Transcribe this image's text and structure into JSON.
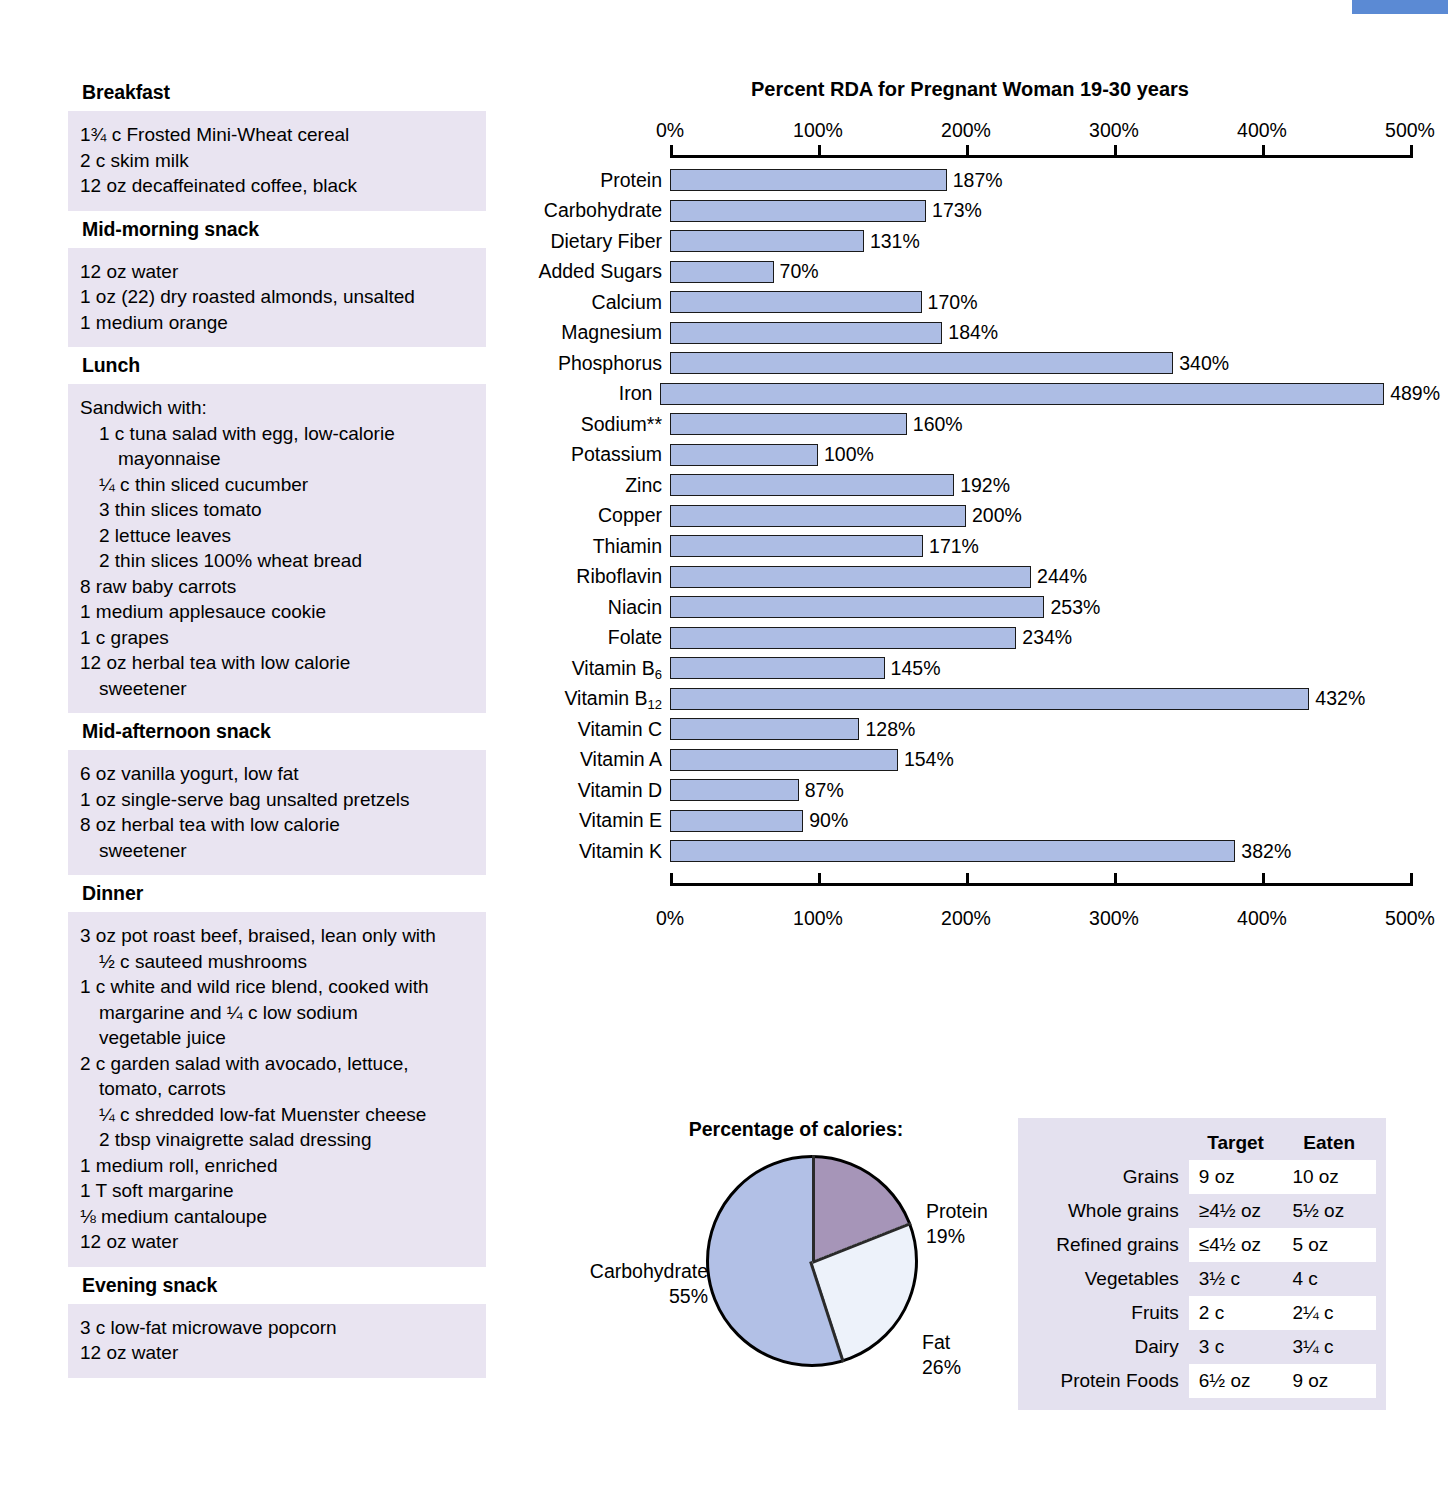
{
  "meals": [
    {
      "heading": "Breakfast",
      "items": [
        {
          "text": "1¾ c Frosted Mini-Wheat cereal",
          "indent": 0
        },
        {
          "text": "2 c skim milk",
          "indent": 0
        },
        {
          "text": "12 oz decaffeinated coffee, black",
          "indent": 0
        }
      ]
    },
    {
      "heading": "Mid-morning snack",
      "items": [
        {
          "text": "12 oz water",
          "indent": 0
        },
        {
          "text": "1 oz (22) dry roasted almonds, unsalted",
          "indent": 0
        },
        {
          "text": "1 medium orange",
          "indent": 0
        }
      ]
    },
    {
      "heading": "Lunch",
      "items": [
        {
          "text": "Sandwich with:",
          "indent": 0
        },
        {
          "text": "1 c tuna salad with egg, low-calorie",
          "indent": 1
        },
        {
          "text": "mayonnaise",
          "indent": 2
        },
        {
          "text": "¼ c thin sliced cucumber",
          "indent": 1
        },
        {
          "text": "3 thin slices tomato",
          "indent": 1
        },
        {
          "text": "2 lettuce leaves",
          "indent": 1
        },
        {
          "text": "2 thin slices 100% wheat bread",
          "indent": 1
        },
        {
          "text": "8 raw baby carrots",
          "indent": 0
        },
        {
          "text": "1 medium applesauce cookie",
          "indent": 0
        },
        {
          "text": "1 c grapes",
          "indent": 0
        },
        {
          "text": "12 oz herbal tea with low calorie",
          "indent": 0
        },
        {
          "text": "sweetener",
          "indent": 1
        }
      ]
    },
    {
      "heading": "Mid-afternoon snack",
      "items": [
        {
          "text": "6 oz vanilla yogurt, low fat",
          "indent": 0
        },
        {
          "text": "1 oz single-serve bag unsalted pretzels",
          "indent": 0
        },
        {
          "text": "8 oz herbal tea with low calorie",
          "indent": 0
        },
        {
          "text": "sweetener",
          "indent": 1
        }
      ]
    },
    {
      "heading": "Dinner",
      "items": [
        {
          "text": "3 oz pot roast beef, braised, lean only with",
          "indent": 0
        },
        {
          "text": "½ c sauteed mushrooms",
          "indent": 1
        },
        {
          "text": "1 c white and wild rice blend, cooked with",
          "indent": 0
        },
        {
          "text": "margarine and ¼ c low sodium",
          "indent": 1
        },
        {
          "text": "vegetable juice",
          "indent": 1
        },
        {
          "text": "2 c garden salad with avocado, lettuce,",
          "indent": 0
        },
        {
          "text": "tomato, carrots",
          "indent": 1
        },
        {
          "text": "¼ c shredded low-fat Muenster cheese",
          "indent": 1
        },
        {
          "text": "2 tbsp vinaigrette salad dressing",
          "indent": 1
        },
        {
          "text": "1 medium roll, enriched",
          "indent": 0
        },
        {
          "text": "1 T soft margarine",
          "indent": 0
        },
        {
          "text": "⅛ medium cantaloupe",
          "indent": 0
        },
        {
          "text": "12 oz water",
          "indent": 0
        }
      ]
    },
    {
      "heading": "Evening snack",
      "items": [
        {
          "text": "3 c low-fat microwave popcorn",
          "indent": 0
        },
        {
          "text": "12 oz water",
          "indent": 0
        }
      ]
    }
  ],
  "chart_data": [
    {
      "type": "bar",
      "title": "Percent RDA for Pregnant Woman 19-30 years",
      "orientation": "horizontal",
      "xlabel": "",
      "ylabel": "",
      "xlim": [
        0,
        500
      ],
      "xticks": [
        0,
        100,
        200,
        300,
        400,
        500
      ],
      "xtick_labels": [
        "0%",
        "100%",
        "200%",
        "300%",
        "400%",
        "500%"
      ],
      "grid": false,
      "axis_top": true,
      "axis_bottom": true,
      "bar_color": "#adbde4",
      "bar_border": "#1a1a1a",
      "categories": [
        "Protein",
        "Carbohydrate",
        "Dietary Fiber",
        "Added Sugars",
        "Calcium",
        "Magnesium",
        "Phosphorus",
        "Iron",
        "Sodium**",
        "Potassium",
        "Zinc",
        "Copper",
        "Thiamin",
        "Riboflavin",
        "Niacin",
        "Folate",
        "Vitamin B6",
        "Vitamin B12",
        "Vitamin C",
        "Vitamin A",
        "Vitamin D",
        "Vitamin E",
        "Vitamin K"
      ],
      "values": [
        187,
        173,
        131,
        70,
        170,
        184,
        340,
        489,
        160,
        100,
        192,
        200,
        171,
        244,
        253,
        234,
        145,
        432,
        128,
        154,
        87,
        90,
        382
      ],
      "value_labels": [
        "187%",
        "173%",
        "131%",
        "70%",
        "170%",
        "184%",
        "340%",
        "489%",
        "160%",
        "100%",
        "192%",
        "200%",
        "171%",
        "244%",
        "253%",
        "234%",
        "145%",
        "432%",
        "128%",
        "154%",
        "87%",
        "90%",
        "382%"
      ],
      "bars": [
        {
          "label": "Protein",
          "value": 187,
          "value_label": "187%",
          "sub": ""
        },
        {
          "label": "Carbohydrate",
          "value": 173,
          "value_label": "173%",
          "sub": ""
        },
        {
          "label": "Dietary Fiber",
          "value": 131,
          "value_label": "131%",
          "sub": ""
        },
        {
          "label": "Added Sugars",
          "value": 70,
          "value_label": "70%",
          "sub": ""
        },
        {
          "label": "Calcium",
          "value": 170,
          "value_label": "170%",
          "sub": ""
        },
        {
          "label": "Magnesium",
          "value": 184,
          "value_label": "184%",
          "sub": ""
        },
        {
          "label": "Phosphorus",
          "value": 340,
          "value_label": "340%",
          "sub": ""
        },
        {
          "label": "Iron",
          "value": 489,
          "value_label": "489%",
          "sub": ""
        },
        {
          "label": "Sodium**",
          "value": 160,
          "value_label": "160%",
          "sub": ""
        },
        {
          "label": "Potassium",
          "value": 100,
          "value_label": "100%",
          "sub": ""
        },
        {
          "label": "Zinc",
          "value": 192,
          "value_label": "192%",
          "sub": ""
        },
        {
          "label": "Copper",
          "value": 200,
          "value_label": "200%",
          "sub": ""
        },
        {
          "label": "Thiamin",
          "value": 171,
          "value_label": "171%",
          "sub": ""
        },
        {
          "label": "Riboflavin",
          "value": 244,
          "value_label": "244%",
          "sub": ""
        },
        {
          "label": "Niacin",
          "value": 253,
          "value_label": "253%",
          "sub": ""
        },
        {
          "label": "Folate",
          "value": 234,
          "value_label": "234%",
          "sub": ""
        },
        {
          "label": "Vitamin B",
          "value": 145,
          "value_label": "145%",
          "sub": "6"
        },
        {
          "label": "Vitamin B",
          "value": 432,
          "value_label": "432%",
          "sub": "12"
        },
        {
          "label": "Vitamin C",
          "value": 128,
          "value_label": "128%",
          "sub": ""
        },
        {
          "label": "Vitamin A",
          "value": 154,
          "value_label": "154%",
          "sub": ""
        },
        {
          "label": "Vitamin D",
          "value": 87,
          "value_label": "87%",
          "sub": ""
        },
        {
          "label": "Vitamin E",
          "value": 90,
          "value_label": "90%",
          "sub": ""
        },
        {
          "label": "Vitamin K",
          "value": 382,
          "value_label": "382%",
          "sub": ""
        }
      ]
    },
    {
      "type": "pie",
      "title": "Percentage of calories:",
      "labels": [
        "Protein",
        "Fat",
        "Carbohydrate"
      ],
      "values": [
        19,
        26,
        55
      ],
      "value_labels": [
        "19%",
        "26%",
        "55%"
      ],
      "colors": [
        "#a695b8",
        "#edf2fa",
        "#b2c0e6"
      ],
      "legend_position": "outside-labels",
      "slices": [
        {
          "name": "Protein",
          "value": 19,
          "value_label": "19%",
          "color": "#a695b8"
        },
        {
          "name": "Fat",
          "value": 26,
          "value_label": "26%",
          "color": "#edf2fa"
        },
        {
          "name": "Carbohydrate",
          "value": 55,
          "value_label": "55%",
          "color": "#b2c0e6"
        }
      ]
    },
    {
      "type": "table",
      "title": "",
      "columns": [
        "",
        "Target",
        "Eaten"
      ],
      "rows": [
        [
          "Grains",
          "9 oz",
          "10 oz"
        ],
        [
          "Whole grains",
          "≥4½ oz",
          "5½ oz"
        ],
        [
          "Refined grains",
          "≤4½ oz",
          "5 oz"
        ],
        [
          "Vegetables",
          "3½ c",
          "4 c"
        ],
        [
          "Fruits",
          "2 c",
          "2¼ c"
        ],
        [
          "Dairy",
          "3 c",
          "3¼ c"
        ],
        [
          "Protein Foods",
          "6½ oz",
          "9 oz"
        ]
      ]
    }
  ]
}
